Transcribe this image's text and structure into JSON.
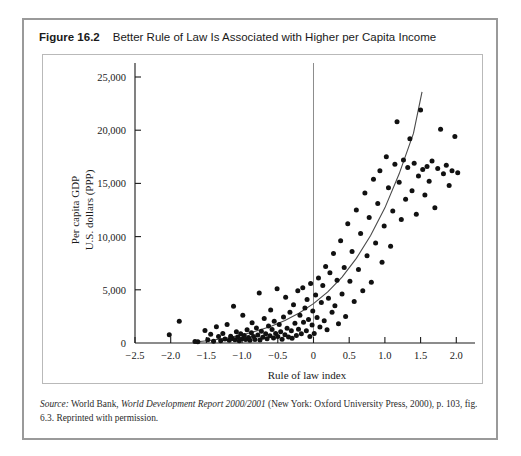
{
  "figure": {
    "number": "Figure 16.2",
    "caption": "Better Rule of Law Is Associated with Higher per Capita Income"
  },
  "source": {
    "prefix": "Source:",
    "text_1": " World Bank, ",
    "italic_title": "World Development Report 2000/2001",
    "text_2": " (New York: Oxford University Press, 2000), p. 103, fig. 6.3. Reprinted with permission."
  },
  "chart_data": {
    "type": "scatter",
    "title": "Better Rule of Law Is Associated with Higher per Capita Income",
    "xlabel": "Rule of law index",
    "ylabel": "Per capita GDP\nU.S. dollars (PPP)",
    "ylabel_line1": "Per capita GDP",
    "ylabel_line2": "U.S. dollars (PPP)",
    "xlim": [
      -2.5,
      2.15
    ],
    "ylim": [
      0,
      25000
    ],
    "xticks": [
      -2.5,
      -2.0,
      -1.5,
      -1.0,
      -0.5,
      0,
      0.5,
      1.0,
      1.5,
      2.0
    ],
    "xticklabels": [
      "−2.5",
      "−2.0",
      "−1.5",
      "−1.0",
      "−0.5",
      "0",
      "0.5",
      "1.0",
      "1.5",
      "2.0"
    ],
    "yticks": [
      0,
      5000,
      10000,
      15000,
      20000,
      25000
    ],
    "yticklabels": [
      "0",
      "5,000",
      "10,000",
      "15,000",
      "20,000",
      "25,000"
    ],
    "grid": false,
    "legend": false,
    "reference_line": {
      "type": "vertical",
      "x": 0,
      "color": "#8c8c8c"
    },
    "trend": {
      "type": "exponential-fit",
      "color": "#4a4a4a",
      "points": [
        [
          -1.62,
          120
        ],
        [
          -1.4,
          280
        ],
        [
          -1.2,
          480
        ],
        [
          -1.0,
          760
        ],
        [
          -0.8,
          1120
        ],
        [
          -0.6,
          1560
        ],
        [
          -0.4,
          2120
        ],
        [
          -0.2,
          2820
        ],
        [
          0.0,
          3700
        ],
        [
          0.2,
          4800
        ],
        [
          0.4,
          6200
        ],
        [
          0.6,
          7950
        ],
        [
          0.8,
          10100
        ],
        [
          1.0,
          12700
        ],
        [
          1.2,
          15900
        ],
        [
          1.4,
          19700
        ],
        [
          1.52,
          23600
        ]
      ]
    },
    "points": [
      [
        -2.02,
        780
      ],
      [
        -1.88,
        2050
      ],
      [
        -1.66,
        140
      ],
      [
        -1.62,
        120
      ],
      [
        -1.52,
        1180
      ],
      [
        -1.48,
        300
      ],
      [
        -1.44,
        820
      ],
      [
        -1.4,
        170
      ],
      [
        -1.36,
        1520
      ],
      [
        -1.33,
        600
      ],
      [
        -1.3,
        210
      ],
      [
        -1.27,
        900
      ],
      [
        -1.24,
        380
      ],
      [
        -1.21,
        1750
      ],
      [
        -1.18,
        250
      ],
      [
        -1.16,
        640
      ],
      [
        -1.14,
        430
      ],
      [
        -1.12,
        3450
      ],
      [
        -1.1,
        300
      ],
      [
        -1.08,
        1050
      ],
      [
        -1.06,
        560
      ],
      [
        -1.04,
        220
      ],
      [
        -1.02,
        880
      ],
      [
        -1.0,
        400
      ],
      [
        -0.99,
        2600
      ],
      [
        -0.97,
        700
      ],
      [
        -0.95,
        330
      ],
      [
        -0.93,
        1250
      ],
      [
        -0.91,
        520
      ],
      [
        -0.89,
        260
      ],
      [
        -0.87,
        960
      ],
      [
        -0.86,
        1900
      ],
      [
        -0.84,
        610
      ],
      [
        -0.82,
        340
      ],
      [
        -0.8,
        1420
      ],
      [
        -0.78,
        750
      ],
      [
        -0.76,
        4700
      ],
      [
        -0.75,
        290
      ],
      [
        -0.73,
        1100
      ],
      [
        -0.71,
        530
      ],
      [
        -0.69,
        2300
      ],
      [
        -0.67,
        860
      ],
      [
        -0.65,
        390
      ],
      [
        -0.63,
        1600
      ],
      [
        -0.61,
        680
      ],
      [
        -0.6,
        3100
      ],
      [
        -0.58,
        1280
      ],
      [
        -0.56,
        470
      ],
      [
        -0.55,
        2050
      ],
      [
        -0.53,
        900
      ],
      [
        -0.51,
        5100
      ],
      [
        -0.5,
        620
      ],
      [
        -0.48,
        1750
      ],
      [
        -0.46,
        1050
      ],
      [
        -0.44,
        350
      ],
      [
        -0.42,
        2450
      ],
      [
        -0.4,
        780
      ],
      [
        -0.39,
        4300
      ],
      [
        -0.37,
        1380
      ],
      [
        -0.35,
        560
      ],
      [
        -0.33,
        2900
      ],
      [
        -0.31,
        1150
      ],
      [
        -0.3,
        450
      ],
      [
        -0.28,
        3600
      ],
      [
        -0.26,
        1850
      ],
      [
        -0.24,
        700
      ],
      [
        -0.22,
        4900
      ],
      [
        -0.21,
        1300
      ],
      [
        -0.19,
        2600
      ],
      [
        -0.17,
        880
      ],
      [
        -0.15,
        5200
      ],
      [
        -0.14,
        1950
      ],
      [
        -0.12,
        3300
      ],
      [
        -0.1,
        1150
      ],
      [
        -0.09,
        4100
      ],
      [
        -0.07,
        2200
      ],
      [
        -0.05,
        620
      ],
      [
        -0.04,
        5600
      ],
      [
        -0.02,
        1700
      ],
      [
        -0.01,
        3000
      ],
      [
        0.01,
        900
      ],
      [
        0.03,
        4500
      ],
      [
        0.05,
        2400
      ],
      [
        0.07,
        6100
      ],
      [
        0.09,
        1500
      ],
      [
        0.11,
        3800
      ],
      [
        0.13,
        5400
      ],
      [
        0.15,
        2100
      ],
      [
        0.17,
        7200
      ],
      [
        0.19,
        1250
      ],
      [
        0.21,
        4200
      ],
      [
        0.23,
        6600
      ],
      [
        0.26,
        2900
      ],
      [
        0.28,
        8400
      ],
      [
        0.3,
        3500
      ],
      [
        0.33,
        5900
      ],
      [
        0.35,
        1800
      ],
      [
        0.38,
        9600
      ],
      [
        0.4,
        4600
      ],
      [
        0.43,
        7100
      ],
      [
        0.45,
        2500
      ],
      [
        0.48,
        11200
      ],
      [
        0.51,
        5800
      ],
      [
        0.54,
        8600
      ],
      [
        0.57,
        3900
      ],
      [
        0.6,
        12500
      ],
      [
        0.63,
        6900
      ],
      [
        0.66,
        10300
      ],
      [
        0.69,
        4900
      ],
      [
        0.72,
        14100
      ],
      [
        0.75,
        8200
      ],
      [
        0.78,
        11800
      ],
      [
        0.81,
        5700
      ],
      [
        0.84,
        15400
      ],
      [
        0.87,
        9400
      ],
      [
        0.9,
        13100
      ],
      [
        0.93,
        16200
      ],
      [
        0.96,
        7600
      ],
      [
        0.99,
        11000
      ],
      [
        1.02,
        17500
      ],
      [
        1.05,
        14600
      ],
      [
        1.08,
        9100
      ],
      [
        1.11,
        12400
      ],
      [
        1.14,
        16800
      ],
      [
        1.17,
        20800
      ],
      [
        1.2,
        15100
      ],
      [
        1.23,
        11600
      ],
      [
        1.26,
        17200
      ],
      [
        1.29,
        13500
      ],
      [
        1.32,
        16500
      ],
      [
        1.35,
        19200
      ],
      [
        1.38,
        14300
      ],
      [
        1.41,
        16900
      ],
      [
        1.44,
        12100
      ],
      [
        1.47,
        15700
      ],
      [
        1.5,
        21900
      ],
      [
        1.53,
        16300
      ],
      [
        1.56,
        13900
      ],
      [
        1.59,
        16600
      ],
      [
        1.62,
        15200
      ],
      [
        1.66,
        17100
      ],
      [
        1.7,
        12700
      ],
      [
        1.74,
        16400
      ],
      [
        1.78,
        20100
      ],
      [
        1.82,
        15900
      ],
      [
        1.86,
        16700
      ],
      [
        1.9,
        14800
      ],
      [
        1.94,
        16200
      ],
      [
        1.98,
        19400
      ],
      [
        2.02,
        16000
      ]
    ]
  }
}
